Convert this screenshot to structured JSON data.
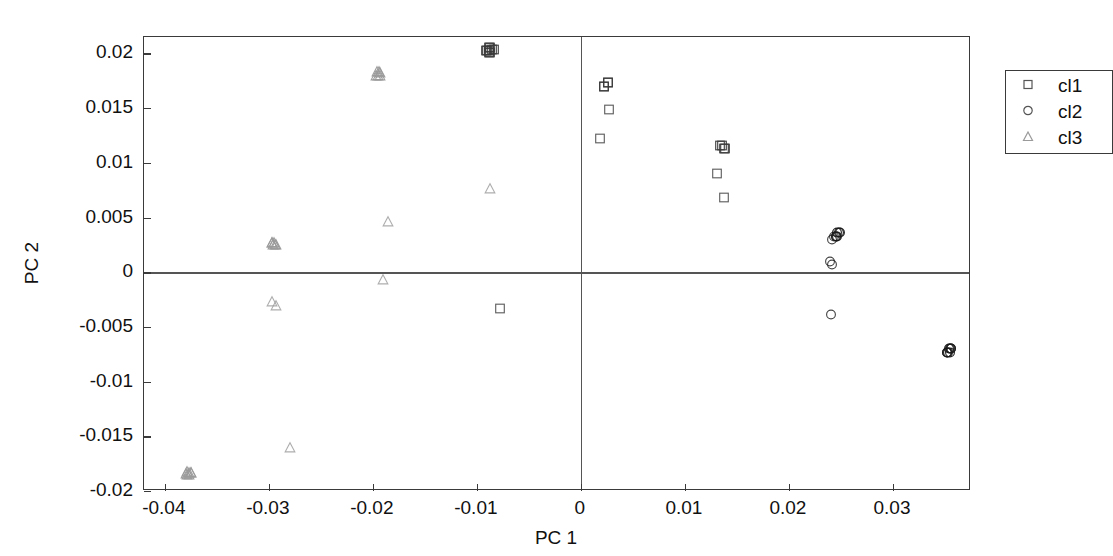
{
  "chart_data": {
    "type": "scatter",
    "title": "",
    "xlabel": "PC 1",
    "ylabel": "PC 2",
    "xlim": [
      -0.042,
      0.0375
    ],
    "ylim": [
      -0.02,
      0.0215
    ],
    "xticks": [
      -0.04,
      -0.03,
      -0.02,
      -0.01,
      0,
      0.01,
      0.02,
      0.03
    ],
    "xticklabels": [
      "-0.04",
      "-0.03",
      "-0.02",
      "-0.01",
      "0",
      "0.01",
      "0.02",
      "0.03"
    ],
    "yticks": [
      0.02,
      0.015,
      0.01,
      0.005,
      0,
      -0.005,
      -0.01,
      -0.015,
      -0.02
    ],
    "yticklabels": [
      "0.02",
      "0.015",
      "0.01",
      "0.005",
      "0",
      "-0.005",
      "-0.01",
      "-0.015",
      "-0.02"
    ],
    "grid": false,
    "zero_lines": true,
    "legend_position": "top-right",
    "legend": [
      "cl1",
      "cl2",
      "cl3"
    ],
    "series": [
      {
        "name": "cl1",
        "marker": "square",
        "color": "#3a3a3a",
        "points": [
          {
            "x": -0.0089,
            "y": 0.0203,
            "overlap": 5
          },
          {
            "x": -0.0086,
            "y": 0.0201,
            "overlap": 4
          },
          {
            "x": -0.0078,
            "y": -0.0035,
            "overlap": 1
          },
          {
            "x": 0.0024,
            "y": 0.017,
            "overlap": 4
          },
          {
            "x": 0.0027,
            "y": 0.0147,
            "overlap": 1
          },
          {
            "x": 0.0018,
            "y": 0.0121,
            "overlap": 1
          },
          {
            "x": 0.0136,
            "y": 0.0113,
            "overlap": 4
          },
          {
            "x": 0.0131,
            "y": 0.0089,
            "overlap": 1
          },
          {
            "x": 0.0138,
            "y": 0.0067,
            "overlap": 1
          }
        ]
      },
      {
        "name": "cl2",
        "marker": "circle",
        "color": "#1a1a1a",
        "points": [
          {
            "x": 0.0247,
            "y": 0.0033,
            "overlap": 5
          },
          {
            "x": 0.0243,
            "y": 0.003,
            "overlap": 3
          },
          {
            "x": 0.0241,
            "y": 0.0007,
            "overlap": 2
          },
          {
            "x": 0.024,
            "y": -0.004,
            "overlap": 1
          },
          {
            "x": 0.0354,
            "y": -0.0073,
            "overlap": 8
          }
        ]
      },
      {
        "name": "cl3",
        "marker": "triangle",
        "color": "#9a9a9a",
        "points": [
          {
            "x": -0.0377,
            "y": -0.0185,
            "overlap": 7
          },
          {
            "x": -0.028,
            "y": -0.0162,
            "overlap": 1
          },
          {
            "x": -0.0295,
            "y": -0.003,
            "overlap": 2
          },
          {
            "x": -0.0295,
            "y": 0.0025,
            "overlap": 6
          },
          {
            "x": -0.019,
            "y": -0.0008,
            "overlap": 1
          },
          {
            "x": -0.0185,
            "y": 0.0045,
            "overlap": 1
          },
          {
            "x": -0.0195,
            "y": 0.018,
            "overlap": 6
          },
          {
            "x": -0.0087,
            "y": 0.0075,
            "overlap": 1
          }
        ]
      }
    ]
  }
}
